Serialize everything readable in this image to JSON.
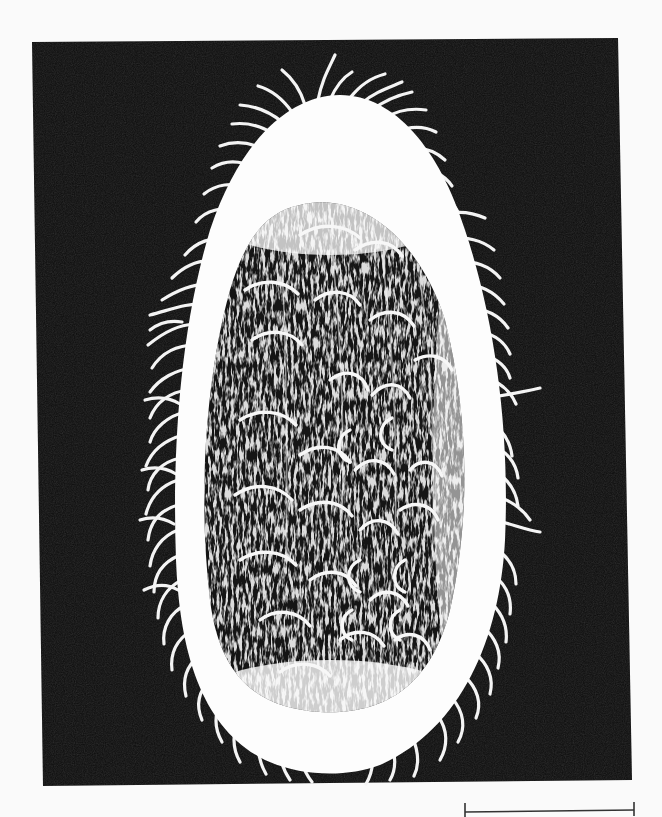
{
  "figure": {
    "kind": "scanning electron micrograph",
    "background_color": "#fafafa",
    "frame_color": "#0c0c0c",
    "cell_color": "#fdfdfd",
    "interior_color": "#151515"
  },
  "scale_bar": {
    "label": "",
    "color": "#333333"
  }
}
